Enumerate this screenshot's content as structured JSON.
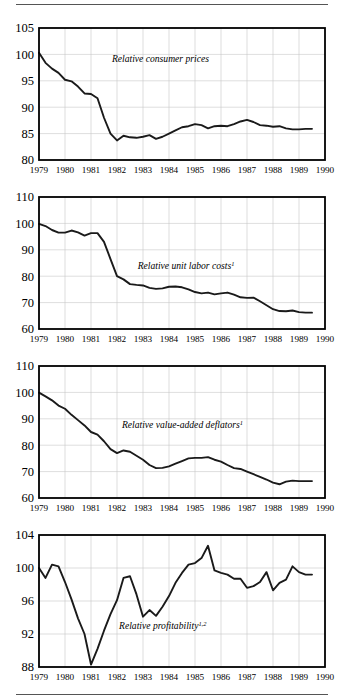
{
  "figure": {
    "panel_count": 4,
    "x_tick_labels": [
      "1979",
      "1980",
      "1981",
      "1982",
      "1983",
      "1984",
      "1985",
      "1986",
      "1987",
      "1988",
      "1989",
      "1990"
    ],
    "rule_color": "#555555",
    "line_color": "#1a1a1a",
    "grid_color": "#c8c8c8",
    "axis_color": "#000000"
  },
  "chart_data": [
    {
      "type": "line",
      "title": "",
      "xlabel": "",
      "ylabel": "",
      "series_label": "Relative consumer prices",
      "series_label_sup": "",
      "grid": true,
      "legend": "inline-annotation",
      "xlim": [
        1979,
        1990
      ],
      "ylim": [
        80,
        105
      ],
      "yticks": [
        80,
        85,
        90,
        95,
        100,
        105
      ],
      "xticks": [
        1979,
        1980,
        1981,
        1982,
        1983,
        1984,
        1985,
        1986,
        1987,
        1988,
        1989,
        1990
      ],
      "x": [
        1979.0,
        1979.25,
        1979.5,
        1979.75,
        1980.0,
        1980.25,
        1980.5,
        1980.75,
        1981.0,
        1981.25,
        1981.5,
        1981.75,
        1982.0,
        1982.25,
        1982.5,
        1982.75,
        1983.0,
        1983.25,
        1983.5,
        1983.75,
        1984.0,
        1984.25,
        1984.5,
        1984.75,
        1985.0,
        1985.25,
        1985.5,
        1985.75,
        1986.0,
        1986.25,
        1986.5,
        1986.75,
        1987.0,
        1987.25,
        1987.5,
        1987.75,
        1988.0,
        1988.25,
        1988.5,
        1988.75,
        1989.0,
        1989.25,
        1989.5
      ],
      "values": [
        100.3,
        98.4,
        97.3,
        96.5,
        95.2,
        94.9,
        93.9,
        92.6,
        92.5,
        91.7,
        88.0,
        85.0,
        83.7,
        84.6,
        84.3,
        84.2,
        84.4,
        84.7,
        84.0,
        84.4,
        85.0,
        85.6,
        86.2,
        86.4,
        86.8,
        86.6,
        86.0,
        86.4,
        86.5,
        86.4,
        86.8,
        87.3,
        87.6,
        87.2,
        86.6,
        86.5,
        86.3,
        86.4,
        86.0,
        85.8,
        85.8,
        85.9,
        85.9
      ]
    },
    {
      "type": "line",
      "title": "",
      "xlabel": "",
      "ylabel": "",
      "series_label": "Relative unit labor costs",
      "series_label_sup": "1",
      "grid": true,
      "legend": "inline-annotation",
      "xlim": [
        1979,
        1990
      ],
      "ylim": [
        60,
        110
      ],
      "yticks": [
        60,
        70,
        80,
        90,
        100,
        110
      ],
      "xticks": [
        1979,
        1980,
        1981,
        1982,
        1983,
        1984,
        1985,
        1986,
        1987,
        1988,
        1989,
        1990
      ],
      "x": [
        1979.0,
        1979.25,
        1979.5,
        1979.75,
        1980.0,
        1980.25,
        1980.5,
        1980.75,
        1981.0,
        1981.25,
        1981.5,
        1981.75,
        1982.0,
        1982.25,
        1982.5,
        1982.75,
        1983.0,
        1983.25,
        1983.5,
        1983.75,
        1984.0,
        1984.25,
        1984.5,
        1984.75,
        1985.0,
        1985.25,
        1985.5,
        1985.75,
        1986.0,
        1986.25,
        1986.5,
        1986.75,
        1987.0,
        1987.25,
        1987.5,
        1987.75,
        1988.0,
        1988.25,
        1988.5,
        1988.75,
        1989.0,
        1989.25,
        1989.5
      ],
      "values": [
        99.8,
        99.0,
        97.5,
        96.5,
        96.5,
        97.3,
        96.6,
        95.4,
        96.3,
        96.3,
        93.0,
        86.5,
        80.0,
        78.8,
        77.0,
        76.7,
        76.5,
        75.6,
        75.2,
        75.4,
        76.0,
        76.1,
        75.8,
        75.0,
        74.0,
        73.5,
        73.8,
        73.1,
        73.5,
        73.8,
        73.0,
        72.0,
        71.8,
        71.9,
        70.5,
        69.0,
        67.5,
        66.8,
        66.7,
        67.0,
        66.4,
        66.2,
        66.2
      ]
    },
    {
      "type": "line",
      "title": "",
      "xlabel": "",
      "ylabel": "",
      "series_label": "Relative value-added deflators",
      "series_label_sup": "1",
      "grid": true,
      "legend": "inline-annotation",
      "xlim": [
        1979,
        1990
      ],
      "ylim": [
        60,
        110
      ],
      "yticks": [
        60,
        70,
        80,
        90,
        100,
        110
      ],
      "xticks": [
        1979,
        1980,
        1981,
        1982,
        1983,
        1984,
        1985,
        1986,
        1987,
        1988,
        1989,
        1990
      ],
      "x": [
        1979.0,
        1979.25,
        1979.5,
        1979.75,
        1980.0,
        1980.25,
        1980.5,
        1980.75,
        1981.0,
        1981.25,
        1981.5,
        1981.75,
        1982.0,
        1982.25,
        1982.5,
        1982.75,
        1983.0,
        1983.25,
        1983.5,
        1983.75,
        1984.0,
        1984.25,
        1984.5,
        1984.75,
        1985.0,
        1985.25,
        1985.5,
        1985.75,
        1986.0,
        1986.25,
        1986.5,
        1986.75,
        1987.0,
        1987.25,
        1987.5,
        1987.75,
        1988.0,
        1988.25,
        1988.5,
        1988.75,
        1989.0,
        1989.25,
        1989.5
      ],
      "values": [
        99.9,
        98.5,
        97.0,
        95.0,
        93.8,
        91.5,
        89.5,
        87.5,
        85.0,
        84.0,
        81.5,
        78.5,
        77.0,
        78.0,
        77.5,
        76.0,
        74.5,
        72.5,
        71.3,
        71.4,
        72.0,
        73.0,
        74.0,
        75.0,
        75.2,
        75.2,
        75.5,
        74.5,
        73.8,
        72.5,
        71.3,
        71.0,
        70.0,
        69.0,
        68.0,
        67.0,
        65.8,
        65.2,
        66.2,
        66.6,
        66.4,
        66.4,
        66.4
      ]
    },
    {
      "type": "line",
      "title": "",
      "xlabel": "",
      "ylabel": "",
      "series_label": "Relative profitability",
      "series_label_sup": "1,2",
      "grid": true,
      "legend": "inline-annotation",
      "xlim": [
        1979,
        1990
      ],
      "ylim": [
        88,
        104
      ],
      "yticks": [
        88,
        92,
        96,
        100,
        104
      ],
      "xticks": [
        1979,
        1980,
        1981,
        1982,
        1983,
        1984,
        1985,
        1986,
        1987,
        1988,
        1989,
        1990
      ],
      "x": [
        1979.0,
        1979.25,
        1979.5,
        1979.75,
        1980.0,
        1980.25,
        1980.5,
        1980.75,
        1981.0,
        1981.25,
        1981.5,
        1981.75,
        1982.0,
        1982.25,
        1982.5,
        1982.75,
        1983.0,
        1983.25,
        1983.5,
        1983.75,
        1984.0,
        1984.25,
        1984.5,
        1984.75,
        1985.0,
        1985.25,
        1985.5,
        1985.75,
        1986.0,
        1986.25,
        1986.5,
        1986.75,
        1987.0,
        1987.25,
        1987.5,
        1987.75,
        1988.0,
        1988.25,
        1988.5,
        1988.75,
        1989.0,
        1989.25,
        1989.5
      ],
      "values": [
        100.0,
        98.8,
        100.4,
        100.2,
        98.3,
        96.2,
        93.9,
        92.0,
        88.3,
        90.2,
        92.4,
        94.4,
        96.1,
        98.8,
        99.0,
        96.8,
        94.1,
        94.9,
        94.2,
        95.3,
        96.6,
        98.2,
        99.4,
        100.4,
        100.6,
        101.2,
        102.7,
        99.7,
        99.4,
        99.2,
        98.7,
        98.7,
        97.6,
        97.8,
        98.3,
        99.5,
        97.3,
        98.2,
        98.6,
        100.2,
        99.5,
        99.2,
        99.2
      ]
    }
  ]
}
